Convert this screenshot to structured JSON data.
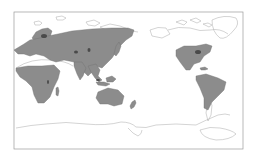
{
  "map": {
    "projection": "pacific-centered-world",
    "frame": {
      "x": 14,
      "y": 12,
      "width": 229,
      "height": 137
    },
    "colors": {
      "background": "#ffffff",
      "frame": "#9a9a9a",
      "coastline": "#a8a8a8",
      "range_fill": "#8c8c8c",
      "range_stroke": "#6e6e6e",
      "dense_spot": "#4a4a4a"
    },
    "shaded_regions": [
      "Europe",
      "Northern Asia",
      "Central Asia",
      "South Asia",
      "Southeast Asia",
      "Japan",
      "Sub-Saharan Africa",
      "Madagascar",
      "Australia",
      "New Zealand",
      "United States",
      "Mexico",
      "Central America",
      "Caribbean",
      "South America"
    ],
    "unshaded_regions": [
      "Sahara",
      "Arctic islands",
      "Canada",
      "Greenland",
      "Antarctica",
      "Southern Argentina"
    ]
  }
}
